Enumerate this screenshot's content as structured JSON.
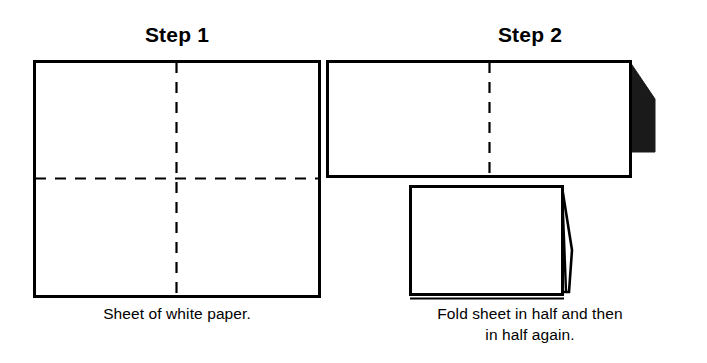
{
  "document": {
    "kind": "instructional-diagram",
    "subject": "Paper folding instructions",
    "background_color": "#ffffff",
    "ink_color": "#000000"
  },
  "steps": [
    {
      "id": "step-1",
      "title": "Step 1",
      "caption_lines": [
        "Sheet of white paper."
      ],
      "figure": {
        "name": "unfolded-sheet",
        "description": "Rectangular sheet with dashed vertical and horizontal fold lines forming a cross",
        "fold_lines": [
          "vertical-center",
          "horizontal-center"
        ],
        "flap": "none"
      }
    },
    {
      "id": "step-2",
      "title": "Step 2",
      "caption_lines": [
        "Fold sheet in half and then",
        "in half again."
      ],
      "figure": {
        "name": "folded-sheet-pair",
        "description": "Sheet folded once (wide rectangle with dark flap) and folded twice (smaller rectangle with open flap)",
        "fold_lines": [
          "vertical-center"
        ],
        "flap": "right-edge"
      }
    }
  ],
  "colors": {
    "paper_fill": "#ffffff",
    "outline": "#000000",
    "shadow_flap": "#1a1a1a"
  }
}
